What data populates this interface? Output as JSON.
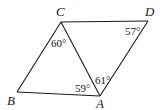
{
  "figure": {
    "vertices": {
      "A": {
        "label": "A",
        "x": 100,
        "y": 96
      },
      "B": {
        "label": "B",
        "x": 17,
        "y": 92
      },
      "C": {
        "label": "C",
        "x": 61,
        "y": 22
      },
      "D": {
        "label": "D",
        "x": 148,
        "y": 21
      }
    },
    "angles": {
      "C_in_ABC": "60°",
      "A_in_ABC": "59°",
      "A_in_ACD": "61°",
      "D_in_ACD": "57°"
    },
    "colors": {
      "stroke": "#1a1a1a",
      "background": "#ffffff"
    }
  }
}
